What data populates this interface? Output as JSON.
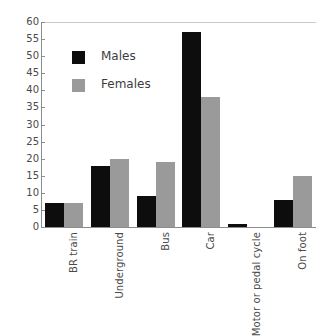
{
  "chart_data": {
    "type": "bar",
    "title": "",
    "subtitle": "",
    "xlabel": "",
    "ylabel": "",
    "ylim": [
      0,
      60
    ],
    "ytick_step": 5,
    "yticks": [
      60,
      55,
      50,
      45,
      40,
      35,
      30,
      25,
      20,
      15,
      10,
      5,
      0
    ],
    "grid": false,
    "legend_position": "inside-top-left",
    "categories": [
      "BR train",
      "Underground",
      "Bus",
      "Car",
      "Motor or pedal cycle",
      "On foot"
    ],
    "series": [
      {
        "name": "Males",
        "color": "#0d0d0d",
        "values": [
          7,
          18,
          9,
          57,
          1,
          8
        ]
      },
      {
        "name": "Females",
        "color": "#9a9a9a",
        "values": [
          7,
          20,
          19,
          38,
          0,
          15
        ]
      }
    ]
  },
  "legend": {
    "items": [
      {
        "label": "Males",
        "swatch": "male-swatch"
      },
      {
        "label": "Females",
        "swatch": "female-swatch"
      }
    ]
  },
  "colors": {
    "male": "#0d0d0d",
    "female": "#9a9a9a",
    "axis": "#8c8c8c",
    "text": "#4a4a4a",
    "background": "#ffffff"
  }
}
